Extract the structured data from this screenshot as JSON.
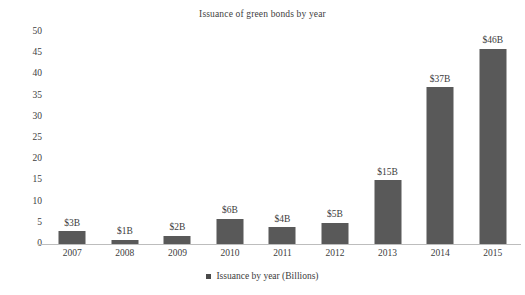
{
  "chart_data": {
    "type": "bar",
    "title": "Issuance of green bonds by year",
    "xlabel": "",
    "ylabel": "",
    "categories": [
      "2007",
      "2008",
      "2009",
      "2010",
      "2011",
      "2012",
      "2013",
      "2014",
      "2015"
    ],
    "values": [
      3,
      1,
      2,
      6,
      4,
      5,
      15,
      37,
      46
    ],
    "point_labels": [
      "$3B",
      "$1B",
      "$2B",
      "$6B",
      "$4B",
      "$5B",
      "$15B",
      "$37B",
      "$46B"
    ],
    "ylim": [
      0,
      50
    ],
    "y_ticks": [
      "0",
      "5",
      "10",
      "15",
      "20",
      "25",
      "30",
      "35",
      "40",
      "45",
      "50"
    ],
    "y_tick_values": [
      0,
      5,
      10,
      15,
      20,
      25,
      30,
      35,
      40,
      45,
      50
    ],
    "grid": false,
    "legend_position": "bottom",
    "series": [
      {
        "name": "Issuance by year (Billions)",
        "values": [
          3,
          1,
          2,
          6,
          4,
          5,
          15,
          37,
          46
        ],
        "color": "#595959"
      }
    ],
    "legend": [
      {
        "marker": "square-marker",
        "label": "Issuance by year (Billions)",
        "color": "#4a4a4a"
      }
    ],
    "colors": {
      "bar_fill": "#595959",
      "axis_line": "#bdbdbd",
      "text": "#3b3b3b",
      "background": "#ffffff"
    }
  }
}
